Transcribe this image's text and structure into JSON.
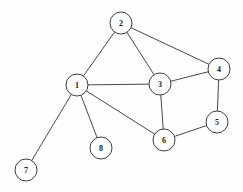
{
  "diagram": {
    "type": "node-link-graph",
    "canvas": {
      "width": 243,
      "height": 192,
      "background": "#fefefe"
    },
    "style": {
      "node_fill": "#ffffff",
      "node_stroke": "#3d3d3d",
      "node_radius": 11,
      "edge_color": "#4a4a4a",
      "edge_width": 1,
      "label_color": "#1a1a1a"
    },
    "nodes": [
      {
        "id": "1",
        "label": "1",
        "x": 77,
        "y": 85
      },
      {
        "id": "2",
        "label": "2",
        "x": 121,
        "y": 23
      },
      {
        "id": "3",
        "label": "3",
        "x": 160,
        "y": 84
      },
      {
        "id": "4",
        "label": "4",
        "x": 219,
        "y": 69
      },
      {
        "id": "5",
        "label": "5",
        "x": 217,
        "y": 122
      },
      {
        "id": "6",
        "label": "6",
        "x": 164,
        "y": 140
      },
      {
        "id": "7",
        "label": "7",
        "x": 26,
        "y": 170
      },
      {
        "id": "8",
        "label": "8",
        "x": 101,
        "y": 148
      }
    ],
    "edges": [
      {
        "source": "1",
        "target": "2"
      },
      {
        "source": "1",
        "target": "3"
      },
      {
        "source": "1",
        "target": "6"
      },
      {
        "source": "1",
        "target": "7"
      },
      {
        "source": "1",
        "target": "8"
      },
      {
        "source": "2",
        "target": "3"
      },
      {
        "source": "2",
        "target": "4"
      },
      {
        "source": "3",
        "target": "4"
      },
      {
        "source": "3",
        "target": "6"
      },
      {
        "source": "4",
        "target": "5"
      },
      {
        "source": "5",
        "target": "6"
      }
    ]
  }
}
